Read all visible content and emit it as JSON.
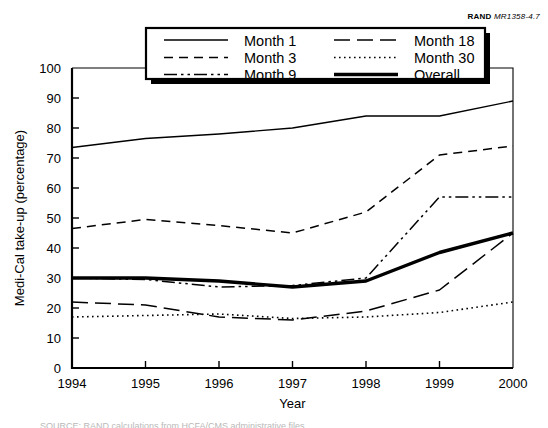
{
  "figure": {
    "source_brand": "RAND",
    "source_number": "MR1358-4.7",
    "caption_partial": "SOURCE: RAND calculations from HCFA/CMS administrative files."
  },
  "chart_data": {
    "type": "line",
    "title": "",
    "xlabel": "Year",
    "ylabel": "Medi-Cal take-up (percentage)",
    "x": [
      1994,
      1995,
      1996,
      1997,
      1998,
      1999,
      2000
    ],
    "xtick_labels": [
      "1994",
      "1995",
      "1996",
      "1997",
      "1998",
      "1999",
      "2000"
    ],
    "xlim": [
      1994,
      2000
    ],
    "ylim": [
      0,
      100
    ],
    "ytick_labels": [
      "0",
      "10",
      "20",
      "30",
      "40",
      "50",
      "60",
      "70",
      "80",
      "90",
      "100"
    ],
    "yticks": [
      0,
      10,
      20,
      30,
      40,
      50,
      60,
      70,
      80,
      90,
      100
    ],
    "grid": false,
    "legend_position": "top-center-inside",
    "series": [
      {
        "name": "Month 1",
        "style": "solid-thin",
        "values": [
          73.5,
          76.5,
          78.0,
          80.0,
          84.0,
          84.0,
          89.0
        ]
      },
      {
        "name": "Month 3",
        "style": "dashed",
        "values": [
          46.5,
          49.5,
          47.5,
          45.0,
          52.0,
          71.0,
          74.0
        ]
      },
      {
        "name": "Month 9",
        "style": "dash-dot-dot",
        "values": [
          30.0,
          29.5,
          27.0,
          27.5,
          30.0,
          57.0,
          57.0
        ]
      },
      {
        "name": "Month 18",
        "style": "long-dash",
        "values": [
          22.0,
          21.0,
          17.0,
          16.0,
          19.0,
          26.0,
          45.0
        ]
      },
      {
        "name": "Month 30",
        "style": "dotted",
        "values": [
          17.0,
          17.5,
          18.0,
          16.5,
          17.0,
          18.5,
          22.0
        ]
      },
      {
        "name": "Overall",
        "style": "solid-thick",
        "values": [
          30.0,
          30.0,
          29.0,
          27.0,
          29.0,
          38.5,
          45.0
        ]
      }
    ],
    "legend_entries": [
      {
        "label": "Month 1",
        "style": "solid-thin",
        "col": 0,
        "row": 0
      },
      {
        "label": "Month 3",
        "style": "dashed",
        "col": 0,
        "row": 1
      },
      {
        "label": "Month 9",
        "style": "dash-dot-dot",
        "col": 0,
        "row": 2
      },
      {
        "label": "Month 18",
        "style": "long-dash",
        "col": 1,
        "row": 0
      },
      {
        "label": "Month 30",
        "style": "dotted",
        "col": 1,
        "row": 1
      },
      {
        "label": "Overall",
        "style": "solid-thick",
        "col": 1,
        "row": 2
      }
    ]
  }
}
